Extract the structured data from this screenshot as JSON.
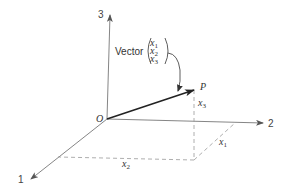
{
  "diagram": {
    "axes": {
      "axis_1": {
        "label": "1"
      },
      "axis_2": {
        "label": "2"
      },
      "axis_3": {
        "label": "3"
      }
    },
    "origin_label": "O",
    "point_label": "P",
    "vector_caption": "Vector",
    "matrix": {
      "rows": [
        {
          "var": "x",
          "sub": "1"
        },
        {
          "var": "x",
          "sub": "2"
        },
        {
          "var": "x",
          "sub": "3"
        }
      ]
    },
    "component_labels": {
      "x1": {
        "var": "x",
        "sub": "1"
      },
      "x2": {
        "var": "x",
        "sub": "2"
      },
      "x3": {
        "var": "x",
        "sub": "3"
      }
    },
    "colors": {
      "axis": "#777777",
      "vector": "#222222",
      "dashed": "#999999",
      "text": "#333333"
    }
  }
}
